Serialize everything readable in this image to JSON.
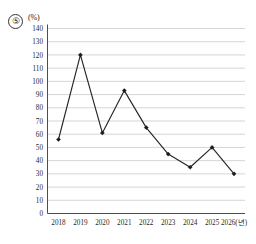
{
  "item": {
    "number": "⑤"
  },
  "chart_data": {
    "type": "line",
    "title": "",
    "subtitle": "",
    "xlabel": "(년)",
    "ylabel": "(%)",
    "unit_label": "(%)",
    "x_unit_suffix": "(년)",
    "categories": [
      "2018",
      "2019",
      "2020",
      "2021",
      "2022",
      "2023",
      "2024",
      "2025",
      "2026"
    ],
    "x_tick_labels": [
      "2018",
      "2019",
      "2020",
      "2021",
      "2022",
      "2023",
      "2024",
      "2025",
      "2026(년)"
    ],
    "values": [
      56,
      120,
      61,
      93,
      65,
      45,
      35,
      50,
      30
    ],
    "y_tick_labels": [
      "0",
      "10",
      "20",
      "30",
      "40",
      "50",
      "60",
      "70",
      "80",
      "90",
      "100",
      "110",
      "120",
      "130",
      "140"
    ],
    "y_ticks": [
      0,
      10,
      20,
      30,
      40,
      50,
      60,
      70,
      80,
      90,
      100,
      110,
      120,
      130,
      140
    ],
    "ylim": [
      0,
      140
    ],
    "grid": true,
    "grid_axis": "y",
    "legend": false,
    "legend_position": "none",
    "marker": "filled-diamond",
    "line_color": "#262626",
    "grid_color": "#b9b9b9",
    "axis_color": "#3a3a3a",
    "background_color": "#ffffff"
  }
}
